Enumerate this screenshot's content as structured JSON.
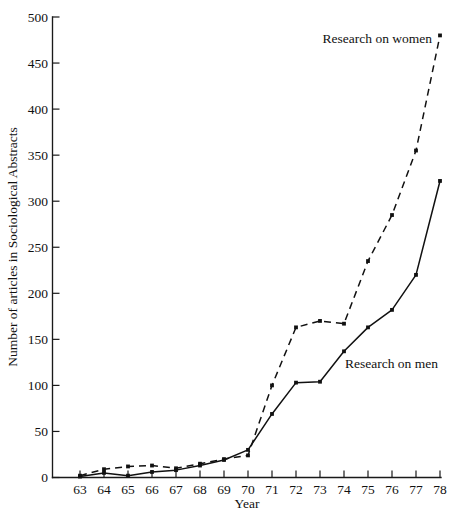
{
  "chart_data": {
    "type": "line",
    "title": "",
    "xlabel": "Year",
    "ylabel": "Number of articles in Sociological Abstracts",
    "x": [
      63,
      64,
      65,
      66,
      67,
      68,
      69,
      70,
      71,
      72,
      73,
      74,
      75,
      76,
      77,
      78
    ],
    "xticklabels": [
      "63",
      "64",
      "65",
      "66",
      "67",
      "68",
      "69",
      "70",
      "71",
      "72",
      "73",
      "74",
      "75",
      "76",
      "77",
      "78"
    ],
    "yticks": [
      0,
      50,
      100,
      150,
      200,
      250,
      300,
      350,
      400,
      450,
      500
    ],
    "yticklabels": [
      "0",
      "50",
      "100",
      "150",
      "200",
      "250",
      "300",
      "350",
      "400",
      "450",
      "500"
    ],
    "xlim": [
      63,
      78
    ],
    "ylim": [
      0,
      500
    ],
    "grid": false,
    "legend_position": "inline-annotations",
    "series": [
      {
        "name": "Research on women",
        "style": "dashed",
        "marker": "square",
        "color": "#111111",
        "values": [
          2,
          9,
          12,
          13,
          10,
          15,
          20,
          24,
          100,
          163,
          170,
          167,
          235,
          285,
          355,
          480
        ]
      },
      {
        "name": "Research on men",
        "style": "solid",
        "marker": "square",
        "color": "#111111",
        "values": [
          1,
          5,
          2,
          6,
          8,
          13,
          19,
          30,
          69,
          103,
          104,
          137,
          163,
          182,
          220,
          322
        ]
      }
    ],
    "annotations": [
      {
        "text": "Research on women",
        "series": "Research on women"
      },
      {
        "text": "Research on men",
        "series": "Research on men"
      }
    ]
  },
  "labels": {
    "y_axis_title": "Number of articles in Sociological Abstracts",
    "x_axis_title": "Year",
    "annotation_women": "Research on women",
    "annotation_men": "Research on men"
  }
}
